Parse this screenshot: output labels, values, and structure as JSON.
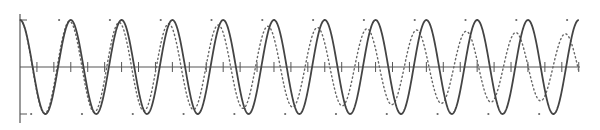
{
  "chart_data": {
    "type": "line",
    "title": "",
    "xlabel": "",
    "ylabel": "",
    "x_range": [
      0,
      11
    ],
    "ylim": [
      -1,
      1
    ],
    "grid": false,
    "legend": null,
    "x_tick_spacing": 0.3333,
    "y_ticks": [
      -1,
      1
    ],
    "series": [
      {
        "name": "solid",
        "style": "solid",
        "color": "#444444",
        "formula": "cos(2*pi*x)",
        "period": 1.0,
        "amplitude_start": 1.0,
        "amplitude_end": 1.0
      },
      {
        "name": "dotted",
        "style": "dotted",
        "color": "#666666",
        "formula": "A(x)*cos(2*pi*x/0.976)",
        "period": 0.976,
        "amplitude_start": 1.0,
        "amplitude_end": 0.7
      }
    ],
    "markers": {
      "top": {
        "y": 1,
        "x_offset": 0.77,
        "count": 11
      },
      "bottom": {
        "y": -1,
        "x_offset": 0.22,
        "count": 11
      }
    }
  },
  "layout": {
    "x0_px": 20,
    "x1_px": 578.8,
    "y_zero_px": 67,
    "y_top_px": 20,
    "y_bottom_px": 115,
    "axis_right_px": 580
  }
}
